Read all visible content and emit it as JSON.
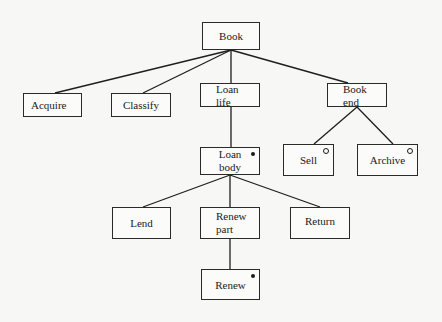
{
  "diagram": {
    "type": "Jackson structure diagram",
    "nodes": [
      {
        "id": "book",
        "label": "Book",
        "x": 202,
        "y": 22,
        "w": 58,
        "h": 28,
        "align": "center",
        "marker": ""
      },
      {
        "id": "acquire",
        "label": "Acquire",
        "x": 23,
        "y": 93,
        "w": 59,
        "h": 24,
        "align": "center",
        "marker": ""
      },
      {
        "id": "classify",
        "label": "Classify",
        "x": 111,
        "y": 93,
        "w": 60,
        "h": 24,
        "align": "center",
        "marker": ""
      },
      {
        "id": "loan-life",
        "label": "Loan\nlife",
        "x": 200,
        "y": 83,
        "w": 60,
        "h": 24,
        "align": "left",
        "marker": ""
      },
      {
        "id": "book-end",
        "label": "Book\nend",
        "x": 327,
        "y": 83,
        "w": 60,
        "h": 24,
        "align": "left",
        "marker": ""
      },
      {
        "id": "loan-body",
        "label": "Loan\nbody",
        "x": 200,
        "y": 147,
        "w": 60,
        "h": 28,
        "align": "center",
        "marker": "iteration"
      },
      {
        "id": "sell",
        "label": "Sell",
        "x": 283,
        "y": 144,
        "w": 51,
        "h": 32,
        "align": "center",
        "marker": "selection"
      },
      {
        "id": "archive",
        "label": "Archive",
        "x": 357,
        "y": 144,
        "w": 61,
        "h": 32,
        "align": "center",
        "marker": "selection"
      },
      {
        "id": "lend",
        "label": "Lend",
        "x": 112,
        "y": 207,
        "w": 59,
        "h": 32,
        "align": "center",
        "marker": ""
      },
      {
        "id": "renew-part",
        "label": "Renew\npart",
        "x": 200,
        "y": 207,
        "w": 60,
        "h": 32,
        "align": "left",
        "marker": ""
      },
      {
        "id": "return",
        "label": "Return",
        "x": 290,
        "y": 207,
        "w": 60,
        "h": 32,
        "align": "center",
        "marker": ""
      },
      {
        "id": "renew",
        "label": "Renew",
        "x": 201,
        "y": 269,
        "w": 59,
        "h": 31,
        "align": "center",
        "marker": "iteration"
      }
    ],
    "edges": [
      {
        "from": "book",
        "to": "acquire"
      },
      {
        "from": "book",
        "to": "classify"
      },
      {
        "from": "book",
        "to": "loan-life"
      },
      {
        "from": "book",
        "to": "book-end"
      },
      {
        "from": "loan-life",
        "to": "loan-body"
      },
      {
        "from": "book-end",
        "to": "sell"
      },
      {
        "from": "book-end",
        "to": "archive"
      },
      {
        "from": "loan-body",
        "to": "lend"
      },
      {
        "from": "loan-body",
        "to": "renew-part"
      },
      {
        "from": "loan-body",
        "to": "return"
      },
      {
        "from": "renew-part",
        "to": "renew"
      }
    ],
    "markers": {
      "iteration": "*",
      "selection": "o"
    }
  },
  "labels": {
    "book": "Book",
    "acquire": "Acquire",
    "classify": "Classify",
    "loan_life": "Loan\nlife",
    "book_end": "Book\nend",
    "loan_body": "Loan\nbody",
    "sell": "Sell",
    "archive": "Archive",
    "lend": "Lend",
    "renew_part": "Renew\npart",
    "return": "Return",
    "renew": "Renew"
  }
}
